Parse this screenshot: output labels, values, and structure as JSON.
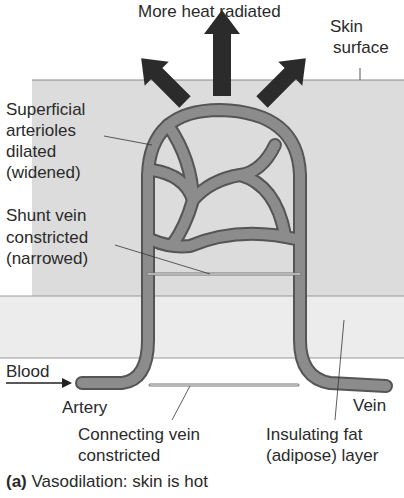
{
  "diagram": {
    "title": "More heat radiated",
    "caption_letter": "(a)",
    "caption_text": "Vasodilation: skin is hot",
    "colors": {
      "skin_layer": "#dcdcdc",
      "fat_layer": "#ececec",
      "vessel": "#8c8c8c",
      "vessel_outline": "#555555",
      "arrow": "#2b2b2b"
    },
    "labels": {
      "skin_surface_1": "Skin",
      "skin_surface_2": "surface",
      "superficial_1": "Superficial",
      "superficial_2": "arterioles",
      "superficial_3": "dilated",
      "superficial_4": "(widened)",
      "shunt_1": "Shunt vein",
      "shunt_2": "constricted",
      "shunt_3": "(narrowed)",
      "blood": "Blood",
      "artery": "Artery",
      "vein": "Vein",
      "connecting_1": "Connecting vein",
      "connecting_2": "constricted",
      "fat_1": "Insulating fat",
      "fat_2": "(adipose) layer"
    }
  }
}
